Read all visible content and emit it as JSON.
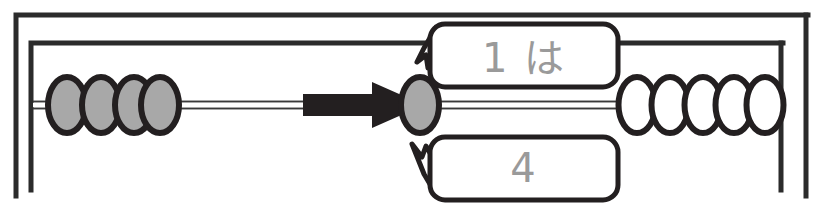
{
  "figure": {
    "kind": "soroban-abacus-rod-diagram",
    "background_color": "#ffffff",
    "ink_color": "#231f20",
    "bead_fill_active": "#a8a8a8",
    "bead_fill_inactive": "#ffffff",
    "bubble_text_color": "#9a9a9a"
  },
  "frame": {
    "outer": {
      "x": 14,
      "y": 13,
      "right": 808,
      "bottom": 196
    },
    "inner": {
      "x": 29,
      "y": 41,
      "right": 783,
      "bottom": 190
    }
  },
  "rod": {
    "y": 105,
    "left": 48,
    "right": 783,
    "style": "double-hairline"
  },
  "beads": {
    "left_group": {
      "label": "left-beads",
      "count": 4,
      "state": "filled",
      "fill": "#a8a8a8",
      "x_start": 48,
      "spacing": 34,
      "rx": 19,
      "ry": 28
    },
    "center_bead": {
      "label": "target-bead",
      "count": 1,
      "state": "filled",
      "fill": "#a8a8a8",
      "cx": 420,
      "cy": 105,
      "rx": 19,
      "ry": 28
    },
    "right_group": {
      "label": "right-beads",
      "count": 5,
      "state": "empty",
      "fill": "#ffffff",
      "x_start": 618,
      "spacing": 33,
      "rx": 18,
      "ry": 28
    }
  },
  "arrow": {
    "label": "move-bead-arrow",
    "direction": "right",
    "color": "#231f20",
    "shaft_x": 303,
    "shaft_end": 372,
    "tip_x": 424,
    "y": 105,
    "shaft_height": 22,
    "head_height": 46
  },
  "bubbles": [
    {
      "id": "bubble-top",
      "name": "callout-bubble-top",
      "text": "1 は",
      "x": 430,
      "y": 24,
      "width": 188,
      "height": 63,
      "radius": 14,
      "tail": "down-left"
    },
    {
      "id": "bubble-bottom",
      "name": "callout-bubble-bottom",
      "text": "4",
      "x": 430,
      "y": 137,
      "width": 188,
      "height": 63,
      "radius": 14,
      "tail": "up-left"
    }
  ],
  "canvas": {
    "width": 818,
    "height": 218
  }
}
